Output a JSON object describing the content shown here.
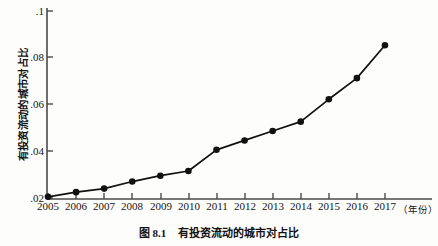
{
  "figure": {
    "caption_number": "图 8.1",
    "caption_text": "有投资流动的城市对占比",
    "y_axis_title": "有投资流动的城市对占比",
    "x_axis_unit": "（年份）"
  },
  "chart_data": {
    "type": "line",
    "title": "有投资流动的城市对占比",
    "xlabel": "（年份）",
    "ylabel": "有投资流动的城市对占比",
    "categories": [
      "2005",
      "2006",
      "2007",
      "2008",
      "2009",
      "2010",
      "2011",
      "2012",
      "2013",
      "2014",
      "2015",
      "2016",
      "2017"
    ],
    "x": [
      2005,
      2006,
      2007,
      2008,
      2009,
      2010,
      2011,
      2012,
      2013,
      2014,
      2015,
      2016,
      2017
    ],
    "values": [
      0.0205,
      0.0225,
      0.024,
      0.027,
      0.0295,
      0.0315,
      0.0405,
      0.0445,
      0.0485,
      0.0525,
      0.062,
      0.071,
      0.085
    ],
    "ylim": [
      0.018,
      0.1
    ],
    "xlim": [
      2004.6,
      2017.4
    ],
    "y_ticks": [
      0.02,
      0.04,
      0.06,
      0.08,
      0.1
    ],
    "y_tick_labels": [
      ".02",
      ".04",
      ".06",
      ".08",
      ".1"
    ],
    "x_ticks": [
      2005,
      2006,
      2007,
      2008,
      2009,
      2010,
      2011,
      2012,
      2013,
      2014,
      2015,
      2016,
      2017
    ],
    "grid": false,
    "legend": null,
    "marker": "circle",
    "line_color": "#111111",
    "marker_color": "#111111",
    "axis_color": "#4a4a4a"
  }
}
